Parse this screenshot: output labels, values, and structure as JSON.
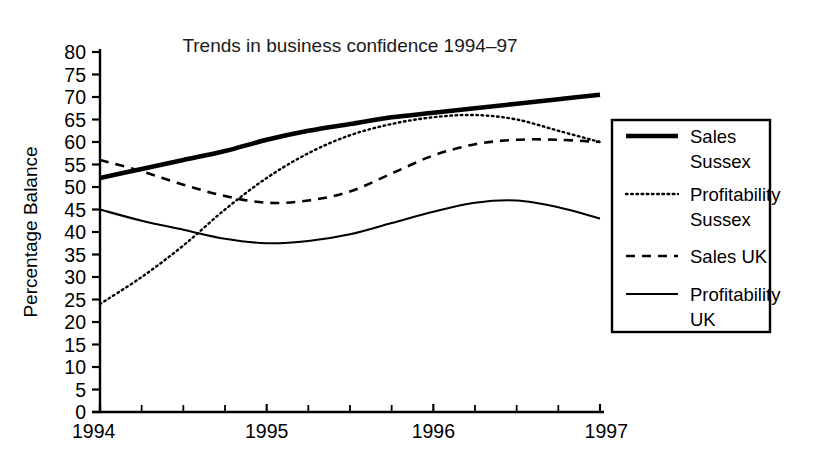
{
  "chart_data": {
    "type": "line",
    "title": "Trends in business confidence 1994–97",
    "xlabel": "",
    "ylabel": "Percentage Balance",
    "xlim": [
      1994,
      1997
    ],
    "ylim": [
      0,
      80
    ],
    "ytick_step": 5,
    "yticks": [
      0,
      5,
      10,
      15,
      20,
      25,
      30,
      35,
      40,
      45,
      50,
      55,
      60,
      65,
      70,
      75,
      80
    ],
    "ytick_labels": [
      "0",
      "5",
      "10",
      "15",
      "20",
      "25",
      "30",
      "35",
      "40",
      "45",
      "50",
      "55",
      "60",
      "65",
      "70",
      "75",
      "80"
    ],
    "xticks": [
      1994,
      1995,
      1996,
      1997
    ],
    "xtick_labels": [
      "1994",
      "1995",
      "1996",
      "1997"
    ],
    "x_minor_ticks_per_interval": 3,
    "grid": false,
    "legend_position": "right-outside",
    "x": [
      1994,
      1994.25,
      1994.5,
      1994.75,
      1995,
      1995.25,
      1995.5,
      1995.75,
      1996,
      1996.25,
      1996.5,
      1996.75,
      1997
    ],
    "series": [
      {
        "name": "Sales Sussex",
        "label_line1": "Sales",
        "label_line2": "Sussex",
        "style": "solid-thick",
        "color": "#000000",
        "values": [
          52,
          54,
          56,
          58,
          60.5,
          62.5,
          64,
          65.5,
          66.5,
          67.5,
          68.5,
          69.5,
          70.5
        ]
      },
      {
        "name": "Profitability Sussex",
        "label_line1": "Profitability",
        "label_line2": "Sussex",
        "style": "dotted",
        "color": "#000000",
        "values": [
          24,
          30,
          37,
          45,
          52,
          57.5,
          61.5,
          64,
          65.5,
          66,
          65,
          62.5,
          60
        ]
      },
      {
        "name": "Sales UK",
        "label_line1": "Sales UK",
        "label_line2": "",
        "style": "dashed",
        "color": "#000000",
        "values": [
          56,
          53.5,
          50.5,
          48,
          46.5,
          47,
          49,
          53,
          57,
          59.5,
          60.5,
          60.5,
          60
        ]
      },
      {
        "name": "Profitability UK",
        "label_line1": "Profitability",
        "label_line2": "UK",
        "style": "solid-thin",
        "color": "#000000",
        "values": [
          45,
          42.5,
          40.5,
          38.5,
          37.5,
          38,
          39.5,
          42,
          44.5,
          46.5,
          47,
          45.5,
          43
        ]
      }
    ]
  },
  "axis": {
    "y_title": "Percentage Balance"
  },
  "legend": {
    "entries": [
      {
        "line1": "Sales",
        "line2": "Sussex"
      },
      {
        "line1": "Profitability",
        "line2": "Sussex"
      },
      {
        "line1": "Sales UK",
        "line2": ""
      },
      {
        "line1": "Profitability",
        "line2": "UK"
      }
    ]
  }
}
